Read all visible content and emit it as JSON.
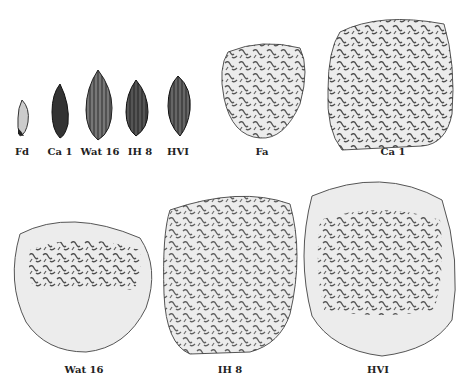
{
  "seeds": [
    {
      "label": "Fd"
    },
    {
      "label": "Ca 1"
    },
    {
      "label": "Wat 16"
    },
    {
      "label": "IH 8"
    },
    {
      "label": "HVI"
    }
  ],
  "cells_top": [
    {
      "label": "Fa"
    },
    {
      "label": "Ca 1"
    }
  ],
  "cells_bottom": [
    {
      "label": "Wat 16"
    },
    {
      "label": "IH 8"
    },
    {
      "label": "HVI"
    }
  ]
}
